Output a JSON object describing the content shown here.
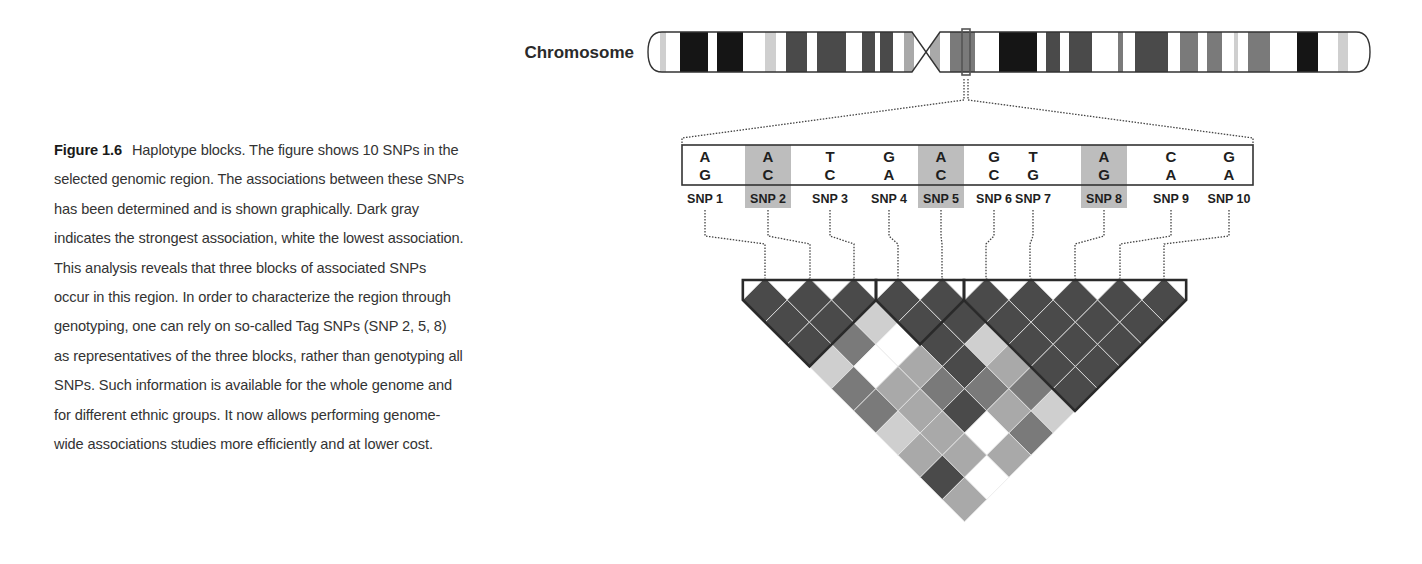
{
  "caption": {
    "label": "Figure 1.6",
    "text": "Haplotype blocks. The figure shows 10 SNPs in the selected genomic region. The associations between these SNPs has been determined and is shown graphically. Dark gray indicates the strongest association, white the lowest association. This analysis reveals that three blocks of associated SNPs occur in this region. In order to characterize the region through genotyping, one can rely on so-called Tag SNPs (SNP 2, 5, 8) as representatives of the three blocks, rather than genotyping all SNPs. Such information is available for the whole genome and for different ethnic groups. It now allows performing genome-wide associations studies more efficiently and at lower cost."
  },
  "colors": {
    "outline": "#333333",
    "tag_highlight": "#bdbdbd",
    "dark": "#4a4a4a",
    "black": "#151515",
    "mid": "#7a7a7a",
    "light": "#a9a9a9",
    "pale": "#cfcfcf",
    "white": "#ffffff"
  },
  "chart_data": {
    "type": "heatmap",
    "title": "Haplotype blocks",
    "chromosome_label": "Chromosome",
    "chromosome": {
      "x_start": 648,
      "x_end": 1370,
      "y_top": 32,
      "y_bottom": 72,
      "centromere_x": 926,
      "selected_region_x": 966,
      "bands": [
        {
          "x": 660,
          "w": 6,
          "shade": "pale"
        },
        {
          "x": 680,
          "w": 28,
          "shade": "black"
        },
        {
          "x": 717,
          "w": 26,
          "shade": "black"
        },
        {
          "x": 765,
          "w": 11,
          "shade": "pale"
        },
        {
          "x": 786,
          "w": 21,
          "shade": "dark"
        },
        {
          "x": 817,
          "w": 29,
          "shade": "dark"
        },
        {
          "x": 862,
          "w": 13,
          "shade": "dark"
        },
        {
          "x": 880,
          "w": 13,
          "shade": "dark"
        },
        {
          "x": 904,
          "w": 10,
          "shade": "light"
        },
        {
          "x": 930,
          "w": 10,
          "shade": "light"
        },
        {
          "x": 950,
          "w": 25,
          "shade": "mid"
        },
        {
          "x": 999,
          "w": 38,
          "shade": "black"
        },
        {
          "x": 1046,
          "w": 14,
          "shade": "dark"
        },
        {
          "x": 1069,
          "w": 23,
          "shade": "dark"
        },
        {
          "x": 1118,
          "w": 5,
          "shade": "mid"
        },
        {
          "x": 1135,
          "w": 33,
          "shade": "dark"
        },
        {
          "x": 1180,
          "w": 18,
          "shade": "mid"
        },
        {
          "x": 1207,
          "w": 15,
          "shade": "mid"
        },
        {
          "x": 1234,
          "w": 4,
          "shade": "pale"
        },
        {
          "x": 1248,
          "w": 22,
          "shade": "mid"
        },
        {
          "x": 1297,
          "w": 21,
          "shade": "black"
        },
        {
          "x": 1338,
          "w": 10,
          "shade": "pale"
        }
      ]
    },
    "snps": [
      {
        "label": "SNP 1",
        "allele_top": "A",
        "allele_bottom": "G",
        "x": 705,
        "tag": false
      },
      {
        "label": "SNP 2",
        "allele_top": "A",
        "allele_bottom": "C",
        "x": 768,
        "tag": true
      },
      {
        "label": "SNP 3",
        "allele_top": "T",
        "allele_bottom": "C",
        "x": 830,
        "tag": false
      },
      {
        "label": "SNP 4",
        "allele_top": "G",
        "allele_bottom": "A",
        "x": 889,
        "tag": false
      },
      {
        "label": "SNP 5",
        "allele_top": "A",
        "allele_bottom": "C",
        "x": 941,
        "tag": true
      },
      {
        "label": "SNP 6",
        "allele_top": "G",
        "allele_bottom": "C",
        "x": 994,
        "tag": false
      },
      {
        "label": "SNP 7",
        "allele_top": "T",
        "allele_bottom": "G",
        "x": 1033,
        "tag": false
      },
      {
        "label": "SNP 8",
        "allele_top": "A",
        "allele_bottom": "G",
        "x": 1104,
        "tag": true
      },
      {
        "label": "SNP 9",
        "allele_top": "C",
        "allele_bottom": "A",
        "x": 1171,
        "tag": false
      },
      {
        "label": "SNP 10",
        "allele_top": "G",
        "allele_bottom": "A",
        "x": 1229,
        "tag": false
      }
    ],
    "heatmap_markers_x": [
      765,
      810,
      854,
      898,
      942,
      986,
      1030,
      1075,
      1120,
      1164
    ],
    "blocks": [
      {
        "name": "Block 1",
        "snps": [
          1,
          2,
          3
        ]
      },
      {
        "name": "Block 2",
        "snps": [
          4,
          5
        ]
      },
      {
        "name": "Block 3",
        "snps": [
          6,
          7,
          8,
          9,
          10
        ]
      }
    ],
    "ld_matrix_shades": [
      [
        "dark",
        "dark",
        "dark",
        "dark",
        "dark",
        "dark",
        "dark",
        "dark",
        "dark",
        "dark"
      ],
      [
        "dark",
        "dark",
        "pale",
        "dark",
        "dark",
        "dark",
        "dark",
        "dark",
        "dark"
      ],
      [
        "dark",
        "mid",
        "white",
        "dark",
        "pale",
        "dark",
        "dark",
        "dark"
      ],
      [
        "pale",
        "white",
        "light",
        "dark",
        "light",
        "dark",
        "dark"
      ],
      [
        "mid",
        "light",
        "mid",
        "mid",
        "mid",
        "dark"
      ],
      [
        "mid",
        "light",
        "dark",
        "light",
        "pale"
      ],
      [
        "pale",
        "light",
        "white",
        "mid"
      ],
      [
        "light",
        "light",
        "light"
      ],
      [
        "dark",
        "white"
      ],
      [
        "light"
      ]
    ],
    "legend": {
      "strongest": "Dark gray",
      "lowest": "White"
    }
  }
}
